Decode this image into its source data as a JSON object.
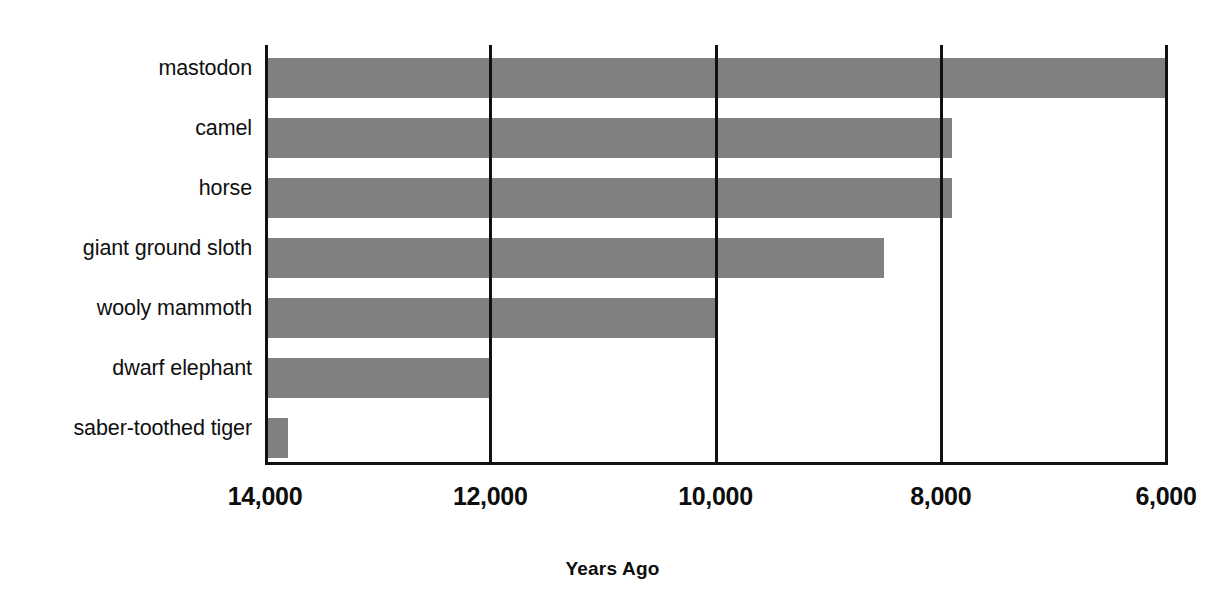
{
  "chart_data": {
    "type": "bar",
    "orientation": "horizontal",
    "title": "",
    "xlabel": "Years Ago",
    "ylabel": "",
    "categories": [
      "mastodon",
      "camel",
      "horse",
      "giant ground sloth",
      "wooly mammoth",
      "dwarf elephant",
      "saber-toothed tiger"
    ],
    "values": [
      6000,
      7900,
      7900,
      8500,
      10000,
      12000,
      13800
    ],
    "bar_start_value": 14000,
    "xlim": [
      14000,
      6000
    ],
    "x_axis_reversed": true,
    "xticks": [
      14000,
      12000,
      10000,
      8000,
      6000
    ],
    "xticklabels": [
      "14,000",
      "12,000",
      "10,000",
      "8,000",
      "6,000"
    ],
    "grid": true,
    "grid_axis": "x",
    "legend": false,
    "bar_color": "#808080",
    "axis_color": "#111111",
    "background_color": "#ffffff"
  },
  "axis": {
    "title": "Years Ago",
    "ticks": [
      "14,000",
      "12,000",
      "10,000",
      "8,000",
      "6,000"
    ]
  },
  "bars": [
    {
      "label": "mastodon",
      "value": 6000
    },
    {
      "label": "camel",
      "value": 7900
    },
    {
      "label": "horse",
      "value": 7900
    },
    {
      "label": "giant ground sloth",
      "value": 8500
    },
    {
      "label": "wooly mammoth",
      "value": 10000
    },
    {
      "label": "dwarf elephant",
      "value": 12000
    },
    {
      "label": "saber-toothed tiger",
      "value": 13800
    }
  ]
}
